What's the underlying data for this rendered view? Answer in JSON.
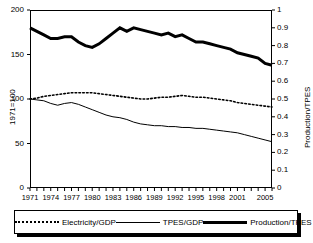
{
  "chart_data": {
    "type": "line",
    "title": "",
    "xlabel": "",
    "ylabel": "1971=100",
    "ylabel_right": "Production/TPES",
    "ylim": [
      0,
      200
    ],
    "ylim_right": [
      0,
      1
    ],
    "yticks": [
      "0",
      "50",
      "100",
      "150",
      "200"
    ],
    "yticks_right": [
      "0",
      "0.1",
      "0.2",
      "0.3",
      "0.4",
      "0.5",
      "0.6",
      "0.7",
      "0.8",
      "0.9",
      "1"
    ],
    "grid": false,
    "legend_position": "bottom",
    "x": [
      1971,
      1972,
      1973,
      1974,
      1975,
      1976,
      1977,
      1978,
      1979,
      1980,
      1981,
      1982,
      1983,
      1984,
      1985,
      1986,
      1987,
      1988,
      1989,
      1990,
      1991,
      1992,
      1993,
      1994,
      1995,
      1996,
      1997,
      1998,
      1999,
      2000,
      2001,
      2002,
      2003,
      2004,
      2005,
      2006
    ],
    "xticks": [
      "1971",
      "1974",
      "1977",
      "1980",
      "1983",
      "1986",
      "1989",
      "1992",
      "1995",
      "1998",
      "2001",
      "2005"
    ],
    "series": [
      {
        "name": "Electricity/GDP",
        "style": "dotted",
        "axis": "left",
        "values": [
          100,
          101,
          103,
          104,
          105,
          106,
          107,
          107,
          107,
          107,
          106,
          105,
          104,
          103,
          102,
          101,
          100,
          100,
          101,
          102,
          102,
          103,
          104,
          103,
          102,
          102,
          101,
          100,
          99,
          98,
          96,
          95,
          94,
          93,
          92,
          91
        ]
      },
      {
        "name": "TPES/GDP",
        "style": "thin",
        "axis": "left",
        "values": [
          100,
          99,
          98,
          95,
          93,
          95,
          96,
          94,
          91,
          88,
          85,
          82,
          80,
          79,
          77,
          74,
          72,
          71,
          70,
          70,
          69,
          69,
          68,
          68,
          67,
          67,
          66,
          65,
          64,
          63,
          62,
          60,
          58,
          56,
          54,
          52
        ]
      },
      {
        "name": "Production/TPES",
        "style": "thick",
        "axis": "right",
        "values": [
          0.9,
          0.88,
          0.86,
          0.84,
          0.84,
          0.85,
          0.85,
          0.82,
          0.8,
          0.79,
          0.81,
          0.84,
          0.87,
          0.9,
          0.88,
          0.9,
          0.89,
          0.88,
          0.87,
          0.86,
          0.87,
          0.85,
          0.86,
          0.84,
          0.82,
          0.82,
          0.81,
          0.8,
          0.79,
          0.78,
          0.76,
          0.75,
          0.74,
          0.73,
          0.7,
          0.69
        ]
      }
    ]
  },
  "legend": {
    "items": [
      {
        "label": "Electricity/GDP",
        "style": "dotted"
      },
      {
        "label": "TPES/GDP",
        "style": "thin"
      },
      {
        "label": "Production/TPES",
        "style": "thick"
      }
    ]
  },
  "colors": {
    "line": "#000000",
    "axis": "#000000",
    "background": "#ffffff"
  }
}
